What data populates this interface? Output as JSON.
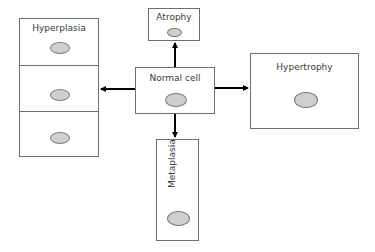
{
  "diagram": {
    "type": "cell-adaptation-diagram",
    "center": {
      "label": "Normal cell"
    },
    "nodes": [
      {
        "id": "hyperplasia",
        "label": "Hyperplasia",
        "direction": "left",
        "cells": 3
      },
      {
        "id": "atrophy",
        "label": "Atrophy",
        "direction": "up",
        "cells": 1
      },
      {
        "id": "hypertrophy",
        "label": "Hypertrophy",
        "direction": "right",
        "cells": 1
      },
      {
        "id": "metaplasia",
        "label": "Metaplasia",
        "direction": "down",
        "cells": 1,
        "label_orientation": "vertical"
      }
    ],
    "edges": [
      {
        "from": "Normal cell",
        "to": "Hyperplasia"
      },
      {
        "from": "Normal cell",
        "to": "Atrophy"
      },
      {
        "from": "Normal cell",
        "to": "Hypertrophy"
      },
      {
        "from": "Normal cell",
        "to": "Metaplasia"
      }
    ],
    "colors": {
      "border": "#6e6e6e",
      "nucleus_fill": "#cfcfcf",
      "arrow": "#000000",
      "text": "#3a3a3a"
    }
  }
}
